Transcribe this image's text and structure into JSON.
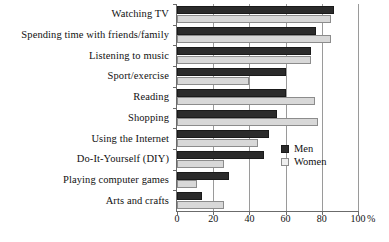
{
  "chart_data": {
    "type": "bar",
    "orientation": "horizontal",
    "title": "",
    "xlabel": "",
    "ylabel": "",
    "unit": "%",
    "xlim": [
      0,
      100
    ],
    "xticks": [
      0,
      20,
      40,
      60,
      80,
      100
    ],
    "xtick_labels": [
      "0",
      "20",
      "40",
      "60",
      "80",
      "100"
    ],
    "grid": true,
    "legend_position": "right-inside",
    "categories": [
      "Watching TV",
      "Spending time with friends/family",
      "Listening to music",
      "Sport/exercise",
      "Reading",
      "Shopping",
      "Using the Internet",
      "Do-It-Yourself (DIY)",
      "Playing computer games",
      "Arts and crafts"
    ],
    "series": [
      {
        "name": "Men",
        "color": "#2b2b2b",
        "values": [
          87,
          77,
          74,
          60,
          60,
          55,
          51,
          48,
          29,
          14
        ]
      },
      {
        "name": "Women",
        "color": "#d8d8d8",
        "values": [
          85,
          85,
          74,
          40,
          76,
          78,
          45,
          26,
          11,
          26
        ]
      }
    ]
  },
  "axis": {
    "unit_suffix": "%"
  },
  "legend": {
    "items": [
      {
        "label": "Men"
      },
      {
        "label": "Women"
      }
    ]
  }
}
